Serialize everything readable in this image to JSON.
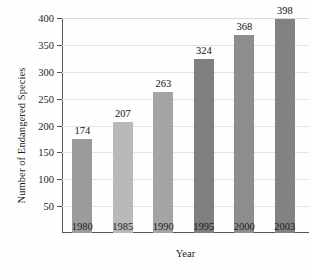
{
  "chart_data": {
    "type": "bar",
    "title": "",
    "subtitle": "",
    "xlabel": "Year",
    "ylabel": "Number of Endangered Species",
    "categories": [
      "1980",
      "1985",
      "1990",
      "1995",
      "2000",
      "2003"
    ],
    "values": [
      174,
      207,
      263,
      324,
      368,
      398
    ],
    "data_labels": [
      "174",
      "207",
      "263",
      "324",
      "368",
      "398"
    ],
    "series": [
      {
        "name": "Number of Endangered Species",
        "values": [
          174,
          207,
          263,
          324,
          368,
          398
        ]
      }
    ],
    "ylim": [
      0,
      400
    ],
    "xlim_categories": 6,
    "ytick_values": [
      50,
      100,
      150,
      200,
      250,
      300,
      350,
      400
    ],
    "ytick_labels": [
      "50",
      "100",
      "150",
      "200",
      "250",
      "300",
      "350",
      "400"
    ],
    "grid": true,
    "grid_axis": "y",
    "legend": false,
    "legend_position": "none",
    "bar_colors": [
      "#9b9b9b",
      "#b9b9b9",
      "#a4a4a4",
      "#7f7f7f",
      "#8d8d8d",
      "#828282"
    ],
    "axis_color": "#555555",
    "grid_color": "#e3e3e3",
    "background_color": "#fefefe",
    "text_color": "#1d1d1d"
  }
}
